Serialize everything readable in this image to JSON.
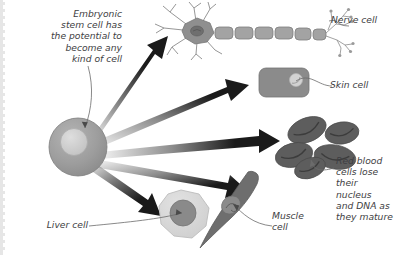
{
  "diagram": {
    "background_color": "#ffffff",
    "text_color": "#3e3e42",
    "arrow_color": "#1a1a1a",
    "page_edge": "perforated-left-edge"
  },
  "captions": {
    "stem_cell": "Embryonic\nstem cell has\nthe potential to\nbecome any\nkind of cell",
    "nerve_cell": "Nerve cell",
    "skin_cell": "Skin cell",
    "red_blood_cells": "Red blood\ncells lose\ntheir nucleus\nand DNA as\nthey mature",
    "muscle_cell": "Muscle\ncell",
    "liver_cell": "Liver cell"
  },
  "cells": [
    {
      "id": "stem-cell",
      "name": "Embryonic stem cell",
      "shape": "circle",
      "body_color": "#9a9a9a",
      "nucleus_color": "#c9c9c9",
      "cx": 78,
      "cy": 147,
      "r": 29
    },
    {
      "id": "nerve-cell",
      "name": "Nerve cell",
      "shape": "neuron-with-myelinated-axon",
      "body_color": "#8f8f8f",
      "nucleus_color": "#6f6f6f",
      "segments": 6
    },
    {
      "id": "skin-cell",
      "name": "Skin cell",
      "shape": "rounded-rectangle",
      "body_color": "#8b8b8b",
      "nucleus_color": "#d0d0d0",
      "x": 259,
      "y": 68,
      "width": 50,
      "height": 29
    },
    {
      "id": "red-blood-cells",
      "name": "Red blood cells",
      "shape": "biconcave-discs",
      "body_color": "#5d5d5d",
      "count": 5
    },
    {
      "id": "muscle-cell",
      "name": "Muscle cell",
      "shape": "spindle",
      "body_color": "#6e6e6e",
      "nucleus_color": "#8e8e8e"
    },
    {
      "id": "liver-cell",
      "name": "Liver cell",
      "shape": "polygon-blob",
      "body_color": "#d4d4d4",
      "nucleus_color": "#8a8a8a",
      "cx": 182,
      "cy": 216
    }
  ],
  "arrows": [
    {
      "id": "arrow-to-nerve",
      "from": "stem-cell",
      "to": "nerve-cell",
      "direction": "up-right"
    },
    {
      "id": "arrow-to-skin",
      "from": "stem-cell",
      "to": "skin-cell",
      "direction": "right-up"
    },
    {
      "id": "arrow-to-rbc",
      "from": "stem-cell",
      "to": "red-blood-cells",
      "direction": "right"
    },
    {
      "id": "arrow-to-muscle",
      "from": "stem-cell",
      "to": "muscle-cell",
      "direction": "right-down"
    },
    {
      "id": "arrow-to-liver",
      "from": "stem-cell",
      "to": "liver-cell",
      "direction": "down-right"
    }
  ]
}
